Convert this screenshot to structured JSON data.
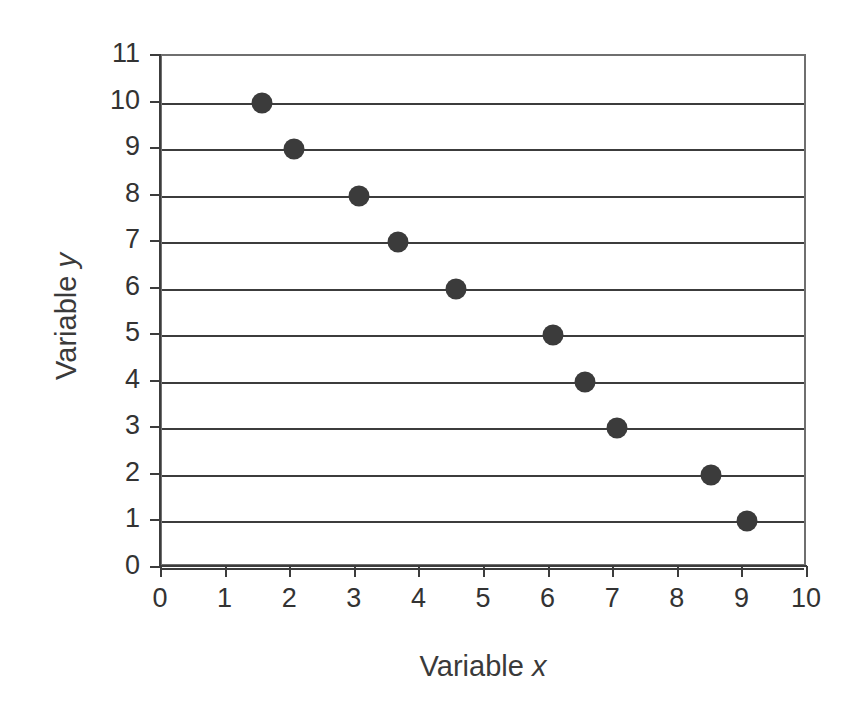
{
  "chart_data": {
    "type": "scatter",
    "title": "",
    "xlabel": "Variable x",
    "ylabel": "Variable y",
    "xlabel_text": "Variable",
    "xlabel_symbol": "x",
    "ylabel_text": "Variable",
    "ylabel_symbol": "y",
    "xlim": [
      0,
      10
    ],
    "ylim": [
      0,
      11
    ],
    "x_ticks": [
      0,
      1,
      2,
      3,
      4,
      5,
      6,
      7,
      8,
      9,
      10
    ],
    "y_ticks": [
      0,
      1,
      2,
      3,
      4,
      5,
      6,
      7,
      8,
      9,
      10,
      11
    ],
    "grid": "horizontal",
    "legend": null,
    "marker_color": "#3b3b3b",
    "axis_color": "#3c3c3c",
    "background_color": "#ffffff",
    "points": [
      {
        "x": 1.55,
        "y": 10
      },
      {
        "x": 2.05,
        "y": 9
      },
      {
        "x": 3.05,
        "y": 8
      },
      {
        "x": 3.65,
        "y": 7
      },
      {
        "x": 4.55,
        "y": 6
      },
      {
        "x": 6.05,
        "y": 5
      },
      {
        "x": 6.55,
        "y": 4
      },
      {
        "x": 7.05,
        "y": 3
      },
      {
        "x": 8.5,
        "y": 2
      },
      {
        "x": 9.05,
        "y": 1
      }
    ]
  }
}
